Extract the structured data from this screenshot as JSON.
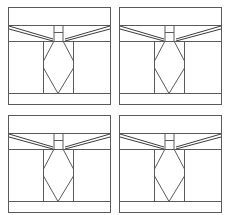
{
  "figure": {
    "title": "",
    "type": "technical-line-drawing-grid",
    "background_color": "#ffffff",
    "stroke_color": "#5a5a5a",
    "stroke_color_dark": "#3c3c3c",
    "stroke_width": 1,
    "grid": {
      "rows": 2,
      "columns": 4,
      "panel_count": 4
    },
    "panels": [
      {
        "id": "panel-top-left",
        "position": "top-left",
        "caption": ""
      },
      {
        "id": "panel-top-right",
        "position": "top-right",
        "caption": ""
      },
      {
        "id": "panel-bottom-left",
        "position": "bottom-left",
        "caption": ""
      },
      {
        "id": "panel-bottom-right",
        "position": "bottom-right",
        "caption": ""
      }
    ],
    "panel_geometry": {
      "description": "structural elevation: outer frame, upper band, angled braces forming a wide V, central H post, lower hexagonal column with V bracing, lower band",
      "outer_frame": {
        "x": 1,
        "y": 1,
        "width": 103,
        "height": 98
      },
      "horizontal_rules_y": [
        5,
        19,
        35,
        87,
        98
      ],
      "vertical_posts_x": [
        36,
        66
      ],
      "center_x": 51,
      "h_post": {
        "left_x": 47,
        "right_x": 56,
        "top_y": 20,
        "bottom_y": 35,
        "crossbar_y": 26
      },
      "hex_column": {
        "top_y": 35,
        "waist_y": 55,
        "bottom_y": 87,
        "left_x": 36,
        "right_x": 66
      },
      "lower_v": {
        "apex_y": 87,
        "left_x": 36,
        "right_x": 66,
        "top_y": 62
      }
    }
  }
}
